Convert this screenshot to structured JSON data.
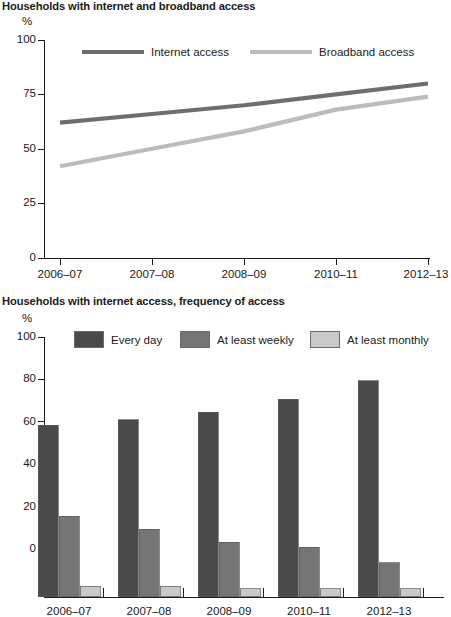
{
  "charts": [
    {
      "id": "line-chart",
      "title": "Households with internet and broadband access",
      "unit_label": "%",
      "xlabel": "",
      "ylabel": "%",
      "legend": [
        {
          "label": "Internet access",
          "color": "#6e6e6e",
          "marker": "line"
        },
        {
          "label": "Broadband access",
          "color": "#bcbcbc",
          "marker": "line"
        }
      ]
    },
    {
      "id": "bar-chart",
      "title": "Households with internet access, frequency of access",
      "unit_label": "%",
      "xlabel": "",
      "ylabel": "%",
      "legend": [
        {
          "label": "Every day",
          "color": "#4a4a4a",
          "marker": "swatch"
        },
        {
          "label": "At least weekly",
          "color": "#757575",
          "marker": "swatch"
        },
        {
          "label": "At least monthly",
          "color": "#c9c9c9",
          "marker": "swatch"
        }
      ]
    }
  ],
  "chart_data": [
    {
      "type": "line",
      "title": "Households with internet and broadband access",
      "xlabel": "",
      "ylabel": "%",
      "ylim": [
        0,
        100
      ],
      "yticks": [
        0,
        25,
        50,
        75,
        100
      ],
      "grid": false,
      "legend_position": "top",
      "categories": [
        "2006–07",
        "2007–08",
        "2008–09",
        "2010–11",
        "2012–13"
      ],
      "series": [
        {
          "name": "Internet access",
          "color": "#6e6e6e",
          "values": [
            62,
            66,
            70,
            75,
            80
          ]
        },
        {
          "name": "Broadband access",
          "color": "#bcbcbc",
          "values": [
            42,
            50,
            58,
            68,
            74
          ]
        }
      ]
    },
    {
      "type": "bar",
      "title": "Households with internet access, frequency of access",
      "xlabel": "",
      "ylabel": "%",
      "ylim": [
        0,
        100
      ],
      "yticks": [
        0,
        20,
        40,
        60,
        80,
        100
      ],
      "grid": false,
      "legend_position": "top",
      "categories": [
        "2006–07",
        "2007–08",
        "2008–09",
        "2010–11",
        "2012–13"
      ],
      "series": [
        {
          "name": "Every day",
          "color": "#4a4a4a",
          "values": [
            66,
            68,
            71,
            76,
            83
          ]
        },
        {
          "name": "At least weekly",
          "color": "#757575",
          "values": [
            31,
            26,
            21,
            19,
            13
          ]
        },
        {
          "name": "At least monthly",
          "color": "#c9c9c9",
          "values": [
            4,
            4,
            3,
            3,
            3
          ]
        }
      ]
    }
  ]
}
